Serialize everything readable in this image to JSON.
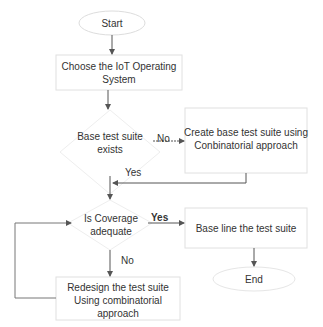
{
  "flowchart": {
    "nodes": {
      "start": {
        "label": "Start",
        "shape": "ellipse"
      },
      "choose_os": {
        "label": "Choose the IoT Operating System",
        "shape": "rect"
      },
      "base_exists": {
        "label": "Base test suite exists",
        "shape": "diamond"
      },
      "create_base": {
        "label": "Create base test suite using Conbinatorial approach",
        "shape": "rect"
      },
      "coverage": {
        "label": "Is Coverage adequate",
        "shape": "diamond"
      },
      "baseline": {
        "label": "Base line the test suite",
        "shape": "rect"
      },
      "redesign": {
        "label": "Redesign the test suite Using combinatorial approach",
        "shape": "rect"
      },
      "end": {
        "label": "End",
        "shape": "ellipse"
      }
    },
    "edge_labels": {
      "no_create": "No",
      "yes_exists": "Yes",
      "yes_coverage": "Yes",
      "no_coverage": "No"
    },
    "colors": {
      "stroke": "#555555",
      "shape_border": "#dddddd",
      "text": "#333333"
    }
  }
}
